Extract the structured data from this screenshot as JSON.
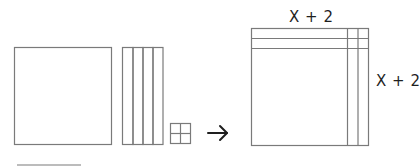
{
  "diagram": {
    "colors": {
      "stroke": "#7a7a7a",
      "text": "#1f1f1f",
      "arrow": "#1f1f1f"
    },
    "left_group": {
      "x_squared_tile": {
        "label": "x²",
        "count": 1
      },
      "x_tiles": {
        "label": "x",
        "count": 4
      },
      "unit_tiles": {
        "label": "1",
        "count": 4
      }
    },
    "arrow": {
      "symbol": "→"
    },
    "right_group": {
      "top_label": "X + 2",
      "side_label": "X + 2"
    }
  }
}
